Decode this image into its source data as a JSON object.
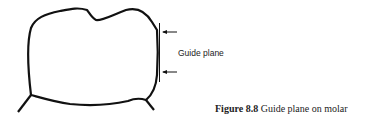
{
  "diagram": {
    "label": "Guide plane",
    "arrows": 2
  },
  "caption": {
    "number": "Figure 8.8",
    "text": " Guide plane on molar"
  }
}
